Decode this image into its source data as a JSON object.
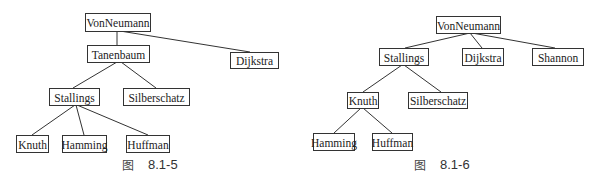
{
  "figures": [
    {
      "id": "8.1-5",
      "caption_prefix": "图",
      "caption_number": "8.1-5",
      "nodes": [
        {
          "key": "VonNeumann",
          "label": "VonNeumann",
          "x": 85,
          "y": 13,
          "w": 65,
          "h": 18
        },
        {
          "key": "Tanenbaum",
          "label": "Tanenbaum",
          "x": 87,
          "y": 45,
          "w": 62,
          "h": 17
        },
        {
          "key": "Dijkstra",
          "label": "Dijkstra",
          "x": 230,
          "y": 52,
          "w": 48,
          "h": 16
        },
        {
          "key": "Stallings",
          "label": "Stallings",
          "x": 49,
          "y": 88,
          "w": 50,
          "h": 17
        },
        {
          "key": "Silberschatz",
          "label": "Silberschatz",
          "x": 123,
          "y": 88,
          "w": 66,
          "h": 17
        },
        {
          "key": "Knuth",
          "label": "Knuth",
          "x": 16,
          "y": 135,
          "w": 32,
          "h": 17
        },
        {
          "key": "Hamming",
          "label": "Hamming",
          "x": 62,
          "y": 135,
          "w": 44,
          "h": 17
        },
        {
          "key": "Huffman",
          "label": "Huffman",
          "x": 126,
          "y": 135,
          "w": 43,
          "h": 17
        }
      ],
      "edges": [
        {
          "from": "VonNeumann",
          "to": "Tanenbaum",
          "x1": 117,
          "y1": 31,
          "x2": 117,
          "y2": 45
        },
        {
          "from": "VonNeumann",
          "to": "Dijkstra",
          "x1": 120,
          "y1": 31,
          "x2": 250,
          "y2": 52
        },
        {
          "from": "Tanenbaum",
          "to": "Stallings",
          "x1": 117,
          "y1": 62,
          "x2": 73,
          "y2": 88
        },
        {
          "from": "Tanenbaum",
          "to": "Silberschatz",
          "x1": 121,
          "y1": 62,
          "x2": 156,
          "y2": 88
        },
        {
          "from": "Stallings",
          "to": "Knuth",
          "x1": 75,
          "y1": 105,
          "x2": 32,
          "y2": 135
        },
        {
          "from": "Stallings",
          "to": "Hamming",
          "x1": 76,
          "y1": 105,
          "x2": 84,
          "y2": 135
        },
        {
          "from": "Stallings",
          "to": "Huffman",
          "x1": 77,
          "y1": 105,
          "x2": 148,
          "y2": 135
        }
      ],
      "caption_x": 122
    },
    {
      "id": "8.1-6",
      "caption_prefix": "图",
      "caption_number": "8.1-6",
      "nodes": [
        {
          "key": "VonNeumann",
          "label": "VonNeumann",
          "x": 436,
          "y": 16,
          "w": 64,
          "h": 17
        },
        {
          "key": "Stallings",
          "label": "Stallings",
          "x": 379,
          "y": 48,
          "w": 49,
          "h": 17
        },
        {
          "key": "Dijkstra",
          "label": "Dijkstra",
          "x": 462,
          "y": 48,
          "w": 41,
          "h": 17
        },
        {
          "key": "Shannon",
          "label": "Shannon",
          "x": 532,
          "y": 48,
          "w": 51,
          "h": 17
        },
        {
          "key": "Knuth",
          "label": "Knuth",
          "x": 347,
          "y": 92,
          "w": 31,
          "h": 16
        },
        {
          "key": "Silberschatz",
          "label": "Silberschatz",
          "x": 408,
          "y": 92,
          "w": 59,
          "h": 16
        },
        {
          "key": "Hamming",
          "label": "Hamming",
          "x": 313,
          "y": 133,
          "w": 41,
          "h": 17
        },
        {
          "key": "Huffman",
          "label": "Huffman",
          "x": 372,
          "y": 133,
          "w": 40,
          "h": 17
        }
      ],
      "edges": [
        {
          "from": "VonNeumann",
          "to": "Stallings",
          "x1": 470,
          "y1": 33,
          "x2": 405,
          "y2": 48
        },
        {
          "from": "VonNeumann",
          "to": "Dijkstra",
          "x1": 470,
          "y1": 33,
          "x2": 482,
          "y2": 48
        },
        {
          "from": "VonNeumann",
          "to": "Shannon",
          "x1": 472,
          "y1": 33,
          "x2": 555,
          "y2": 48
        },
        {
          "from": "Stallings",
          "to": "Knuth",
          "x1": 402,
          "y1": 65,
          "x2": 363,
          "y2": 92
        },
        {
          "from": "Stallings",
          "to": "Silberschatz",
          "x1": 404,
          "y1": 65,
          "x2": 441,
          "y2": 92
        },
        {
          "from": "Knuth",
          "to": "Hamming",
          "x1": 361,
          "y1": 108,
          "x2": 334,
          "y2": 133
        },
        {
          "from": "Knuth",
          "to": "Huffman",
          "x1": 363,
          "y1": 108,
          "x2": 392,
          "y2": 133
        }
      ],
      "caption_x": 414
    }
  ]
}
